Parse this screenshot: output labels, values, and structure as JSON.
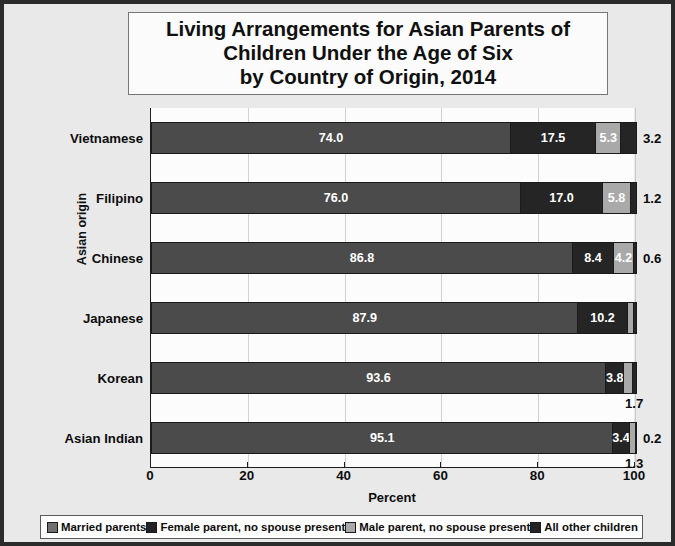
{
  "chart_data": {
    "type": "bar",
    "subtype": "horizontal-stacked-100",
    "title": "Living Arrangements for Asian Parents of Children Under the Age of Six by Country of Origin, 2014",
    "title_lines": [
      "Living Arrangements for Asian Parents of",
      "Children Under the Age of Six",
      "by Country of Origin, 2014"
    ],
    "xlabel": "Percent",
    "ylabel": "Asian origin",
    "xlim": [
      0,
      100
    ],
    "xticks": [
      0,
      20,
      40,
      60,
      80,
      100
    ],
    "xtick_labels": [
      "0",
      "20",
      "40",
      "60",
      "80",
      "100"
    ],
    "grid": "vertical",
    "legend_position": "bottom",
    "categories": [
      "Vietnamese",
      "Filipino",
      "Chinese",
      "Japanese",
      "Korean",
      "Asian Indian"
    ],
    "series": [
      {
        "name": "Married parents",
        "color": "#4b4b4b",
        "values": [
          74.0,
          76.0,
          86.8,
          87.9,
          93.6,
          95.1
        ]
      },
      {
        "name": "Female parent, no spouse present",
        "color": "#252525",
        "values": [
          17.5,
          17.0,
          8.4,
          10.2,
          3.8,
          3.4
        ]
      },
      {
        "name": "Male parent, no spouse present",
        "color": "#a9a9a9",
        "values": [
          5.3,
          5.8,
          4.2,
          1.3,
          1.7,
          1.3
        ]
      },
      {
        "name": "All other children",
        "color": "#252525",
        "values": [
          3.2,
          1.2,
          0.6,
          0.6,
          0.9,
          0.2
        ]
      }
    ],
    "rows": [
      {
        "category": "Vietnamese",
        "segments": [
          {
            "value": "74.0",
            "pct": 74.0,
            "color": "#4b4b4b",
            "label_placement": "inside",
            "label_color": "light"
          },
          {
            "value": "17.5",
            "pct": 17.5,
            "color": "#252525",
            "label_placement": "inside",
            "label_color": "light"
          },
          {
            "value": "5.3",
            "pct": 5.3,
            "color": "#a9a9a9",
            "label_placement": "inside",
            "label_color": "light"
          },
          {
            "value": "3.2",
            "pct": 3.2,
            "color": "#252525",
            "label_placement": "right",
            "label_color": "dark"
          }
        ]
      },
      {
        "category": "Filipino",
        "segments": [
          {
            "value": "76.0",
            "pct": 76.0,
            "color": "#4b4b4b",
            "label_placement": "inside",
            "label_color": "light"
          },
          {
            "value": "17.0",
            "pct": 17.0,
            "color": "#252525",
            "label_placement": "inside",
            "label_color": "light"
          },
          {
            "value": "5.8",
            "pct": 5.8,
            "color": "#a9a9a9",
            "label_placement": "inside",
            "label_color": "light"
          },
          {
            "value": "1.2",
            "pct": 1.2,
            "color": "#252525",
            "label_placement": "right",
            "label_color": "dark"
          }
        ]
      },
      {
        "category": "Chinese",
        "segments": [
          {
            "value": "86.8",
            "pct": 86.8,
            "color": "#4b4b4b",
            "label_placement": "inside",
            "label_color": "light"
          },
          {
            "value": "8.4",
            "pct": 8.4,
            "color": "#252525",
            "label_placement": "inside",
            "label_color": "light"
          },
          {
            "value": "4.2",
            "pct": 4.2,
            "color": "#a9a9a9",
            "label_placement": "inside",
            "label_color": "light"
          },
          {
            "value": "0.6",
            "pct": 0.6,
            "color": "#252525",
            "label_placement": "right",
            "label_color": "dark"
          }
        ]
      },
      {
        "category": "Japanese",
        "segments": [
          {
            "value": "87.9",
            "pct": 87.9,
            "color": "#4b4b4b",
            "label_placement": "inside",
            "label_color": "light"
          },
          {
            "value": "10.2",
            "pct": 10.2,
            "color": "#252525",
            "label_placement": "inside",
            "label_color": "light"
          },
          {
            "value": "",
            "pct": 1.3,
            "color": "#a9a9a9",
            "label_placement": "none",
            "label_color": "dark"
          },
          {
            "value": "",
            "pct": 0.6,
            "color": "#252525",
            "label_placement": "none",
            "label_color": "dark"
          }
        ]
      },
      {
        "category": "Korean",
        "segments": [
          {
            "value": "93.6",
            "pct": 93.6,
            "color": "#4b4b4b",
            "label_placement": "inside",
            "label_color": "light"
          },
          {
            "value": "3.8",
            "pct": 3.8,
            "color": "#252525",
            "label_placement": "inside",
            "label_color": "light"
          },
          {
            "value": "1.7",
            "pct": 1.7,
            "color": "#a9a9a9",
            "label_placement": "below",
            "label_color": "dark"
          },
          {
            "value": "",
            "pct": 0.9,
            "color": "#252525",
            "label_placement": "none",
            "label_color": "dark"
          }
        ]
      },
      {
        "category": "Asian Indian",
        "segments": [
          {
            "value": "95.1",
            "pct": 95.1,
            "color": "#4b4b4b",
            "label_placement": "inside",
            "label_color": "light"
          },
          {
            "value": "3.4",
            "pct": 3.4,
            "color": "#252525",
            "label_placement": "inside",
            "label_color": "light"
          },
          {
            "value": "1.3",
            "pct": 1.3,
            "color": "#a9a9a9",
            "label_placement": "below",
            "label_color": "dark"
          },
          {
            "value": "0.2",
            "pct": 0.2,
            "color": "#252525",
            "label_placement": "right",
            "label_color": "dark"
          }
        ]
      }
    ],
    "legend": [
      {
        "label": "Married parents",
        "color": "#6f6f6f"
      },
      {
        "label": "Female parent, no spouse present",
        "color": "#232323"
      },
      {
        "label": "Male parent, no spouse present",
        "color": "#a9a9a9"
      },
      {
        "label": "All other children",
        "color": "#232323"
      }
    ]
  },
  "colors": {
    "frame": "#2b2b2b",
    "background": "#e9e9e9",
    "plot_background": "#fcfcfc",
    "gridline": "#d2d2d2",
    "married": "#4b4b4b",
    "female_parent": "#252525",
    "male_parent": "#a9a9a9",
    "all_other": "#252525"
  }
}
